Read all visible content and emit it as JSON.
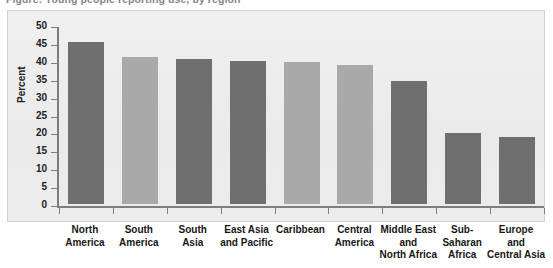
{
  "figure": {
    "title": "Figure: Young people reporting use, by region",
    "y_axis_title": "Percent",
    "y_ticks": [
      "50",
      "45",
      "40",
      "35",
      "30",
      "25",
      "20",
      "15",
      "10",
      "5",
      "0"
    ],
    "colors": {
      "bar_dark": "#6f6f6f",
      "bar_light": "#a9a9a9",
      "panel_background": "#efefef",
      "axis": "#7d7d7d",
      "text": "#1d1d1d"
    }
  },
  "chart_data": {
    "type": "bar",
    "title": "",
    "xlabel": "",
    "ylabel": "Percent",
    "ylim": [
      0,
      50
    ],
    "ytick_step": 5,
    "grid": false,
    "legend": "none",
    "categories": [
      "North America",
      "South America",
      "South Asia",
      "East Asia and Pacific",
      "Caribbean",
      "Central America",
      "Middle East and North Africa",
      "Sub-Saharan Africa",
      "Europe and Central Asia"
    ],
    "category_lines": [
      [
        "North",
        "America"
      ],
      [
        "South",
        "America"
      ],
      [
        "South",
        "Asia"
      ],
      [
        "East Asia",
        "and Pacific"
      ],
      [
        "Caribbean"
      ],
      [
        "Central",
        "America"
      ],
      [
        "Middle East",
        "and",
        "North Africa"
      ],
      [
        "Sub-",
        "Saharan",
        "Africa"
      ],
      [
        "Europe",
        "and",
        "Central Asia"
      ]
    ],
    "values": [
      45.2,
      41.2,
      40.4,
      40.0,
      39.7,
      38.7,
      34.3,
      19.7,
      18.8
    ],
    "bar_colors": [
      "#6f6f6f",
      "#a9a9a9",
      "#6f6f6f",
      "#6f6f6f",
      "#a9a9a9",
      "#a9a9a9",
      "#6f6f6f",
      "#6f6f6f",
      "#6f6f6f"
    ]
  }
}
